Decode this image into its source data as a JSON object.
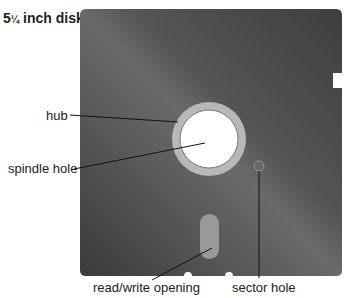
{
  "title": {
    "whole": "5",
    "frac": "¼",
    "rest": " inch disk"
  },
  "labels": {
    "hub": "hub",
    "spindle": "spindle hole",
    "rw": "read/write opening",
    "sector": "sector hole"
  },
  "colors": {
    "disk": "#4a4a4a",
    "hub": "#b8b8b8"
  }
}
